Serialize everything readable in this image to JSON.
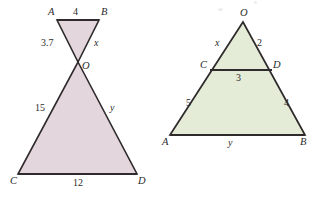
{
  "canvas": {
    "width": 316,
    "height": 205,
    "background": "#ffffff"
  },
  "style": {
    "stroke_color": "#2f2a2b",
    "bowtie_fill": "#e3d6dc",
    "triangle_fill": "#e4ecd7",
    "label_color": "#2a2a2a"
  },
  "figures": [
    {
      "id": "bowtie",
      "name": "vertical-angles-bowtie-figure",
      "description": "Two triangles meeting at point O forming a bowtie: small triangle ABO on top, large triangle CDO below",
      "fill": "#e3d6dc",
      "vertices": {
        "A": {
          "label": "A",
          "x": 57,
          "y": 20
        },
        "B": {
          "label": "B",
          "x": 99,
          "y": 20
        },
        "O": {
          "label": "O",
          "x": 78,
          "y": 62
        },
        "C": {
          "label": "C",
          "x": 18,
          "y": 174
        },
        "D": {
          "label": "D",
          "x": 137,
          "y": 174
        }
      },
      "segment_labels": [
        {
          "name": "segment-ab-length",
          "text": "4",
          "kind": "measure"
        },
        {
          "name": "segment-ao-length",
          "text": "3.7",
          "kind": "measure"
        },
        {
          "name": "segment-bo-length",
          "text": "x",
          "kind": "variable"
        },
        {
          "name": "segment-co-length",
          "text": "15",
          "kind": "measure"
        },
        {
          "name": "segment-do-length",
          "text": "y",
          "kind": "variable"
        },
        {
          "name": "segment-cd-length",
          "text": "12",
          "kind": "measure"
        }
      ]
    },
    {
      "id": "triangle",
      "name": "similar-triangles-figure",
      "description": "Triangle OAB with segment CD parallel to base AB cutting the sides",
      "fill": "#e4ecd7",
      "vertices": {
        "O": {
          "label": "O",
          "x": 243,
          "y": 22
        },
        "C": {
          "label": "C",
          "x": 210,
          "y": 70
        },
        "D": {
          "label": "D",
          "x": 272,
          "y": 70
        },
        "A": {
          "label": "A",
          "x": 170,
          "y": 135
        },
        "B": {
          "label": "B",
          "x": 305,
          "y": 135
        }
      },
      "segment_labels": [
        {
          "name": "segment-oc-length",
          "text": "x",
          "kind": "variable"
        },
        {
          "name": "segment-od-length",
          "text": "2",
          "kind": "measure"
        },
        {
          "name": "segment-cd-length",
          "text": "3",
          "kind": "measure"
        },
        {
          "name": "segment-ca-length",
          "text": "5",
          "kind": "measure"
        },
        {
          "name": "segment-db-length",
          "text": "4",
          "kind": "measure"
        },
        {
          "name": "segment-ab-length",
          "text": "y",
          "kind": "variable"
        }
      ]
    }
  ],
  "labels": {
    "bowtie": {
      "A": "A",
      "B": "B",
      "O": "O",
      "C": "C",
      "D": "D",
      "ab": "4",
      "ao": "3.7",
      "bo": "x",
      "co": "15",
      "do": "y",
      "cd": "12"
    },
    "triangle": {
      "O": "O",
      "C": "C",
      "D": "D",
      "A": "A",
      "B": "B",
      "oc": "x",
      "od": "2",
      "cd": "3",
      "ca": "5",
      "db": "4",
      "ab": "y"
    }
  }
}
